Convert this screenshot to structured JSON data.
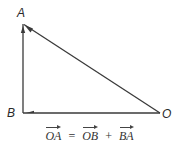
{
  "figure": {
    "type": "vector-triangle",
    "points": {
      "A": {
        "label": "A",
        "x": 23,
        "y": 24
      },
      "B": {
        "label": "B",
        "x": 23,
        "y": 113
      },
      "O": {
        "label": "O",
        "x": 160,
        "y": 113
      }
    },
    "vectors": [
      {
        "name": "OA",
        "from": "O",
        "to": "A"
      },
      {
        "name": "OB",
        "from": "O",
        "to": "B"
      },
      {
        "name": "BA",
        "from": "B",
        "to": "A"
      }
    ],
    "colors": {
      "line": "#3a3a3a",
      "text": "#2a2a2a",
      "background": "#ffffff"
    }
  },
  "labels": {
    "A": "A",
    "B": "B",
    "O": "O"
  },
  "equation": {
    "lhs": "OA",
    "equals": "=",
    "term1": "OB",
    "plus": "+",
    "term2": "BA"
  }
}
